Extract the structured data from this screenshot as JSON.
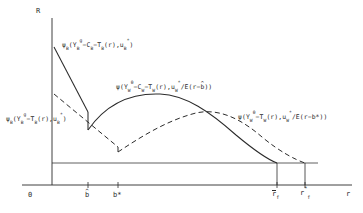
{
  "figure": {
    "type": "economics-line-diagram",
    "axes": {
      "y_label": "R",
      "x_label": "r",
      "origin_label": "0"
    },
    "x_ticks": [
      {
        "id": "b-hat",
        "label_base": "b",
        "accent": "hat",
        "x": 88
      },
      {
        "id": "b-star",
        "label_base": "b*",
        "accent": "none",
        "x": 118
      },
      {
        "id": "r-f-bar",
        "label_base": "r",
        "sub": "f",
        "accent": "bar",
        "x": 277
      },
      {
        "id": "r-f-star",
        "label_base": "r",
        "sub": "f",
        "sup": "*",
        "accent": "none",
        "x": 305
      }
    ],
    "curve_labels": {
      "upper_left": {
        "text": "ψB(YBg−CB−TB(r),uB*)",
        "parts": {
          "psi": "ψ",
          "psi_sub": "B",
          "open": "(Y",
          "y_sub": "B",
          "y_sup": "g",
          "minus_c": "−C",
          "c_sub": "B",
          "minus_t": "−T",
          "t_sub": "B",
          "of_r": "(r)",
          "comma_u": ",u",
          "u_sub": "B",
          "u_sup": "*",
          "close": ")"
        }
      },
      "center": {
        "text": "ψ(YW0−CW−TW(r),uW*/E(r−b̂))",
        "parts": {
          "psi": "ψ",
          "open": "(Y",
          "y_sub": "W",
          "y_sup": "0",
          "minus_c": "−C",
          "c_sub": "W",
          "minus_t": "−T",
          "t_sub": "W",
          "of_r": "(r)",
          "comma_u": ",u",
          "u_sub": "W",
          "u_sup": "*",
          "over_e": "/E(r−",
          "b_hat": "b",
          "close": "))"
        }
      },
      "lower_left": {
        "text": "ψB(YBg−TB(r),uB*)",
        "parts": {
          "psi": "ψ",
          "psi_sub": "B",
          "open": "(Y",
          "y_sub": "B",
          "y_sup": "g",
          "minus_t": "−T",
          "t_sub": "B",
          "of_r": "(r)",
          "comma_u": ",u",
          "u_sub": "B",
          "u_sup": "*",
          "close": ")"
        }
      },
      "right": {
        "text": "ψ(YW0−TW(r),uW*/E(r−b*))",
        "parts": {
          "psi": "ψ",
          "open": "(Y",
          "y_sub": "W",
          "y_sup": "0",
          "minus_t": "−T",
          "t_sub": "W",
          "of_r": "(r)",
          "comma_u": ",u",
          "u_sub": "W",
          "u_sup": "*",
          "over_e": "/E(r−b*))"
        }
      }
    },
    "colors": {
      "line": "#2b2b2b",
      "background": "#ffffff"
    },
    "curves": {
      "solid_bank_segment": "descending straight line from y-axis high point to b-hat, then vertical drop",
      "solid_worker_hump": "concave hump rising from b-hat, peak near r=165, descending to baseline at r-f-bar",
      "dashed_bank_segment": "descending dashed line from y-axis to b-star, vertical drop at b-star",
      "dashed_worker_hump": "dashed hump rising from b-star, peak near r=215, descending to baseline at r-f-star"
    }
  }
}
